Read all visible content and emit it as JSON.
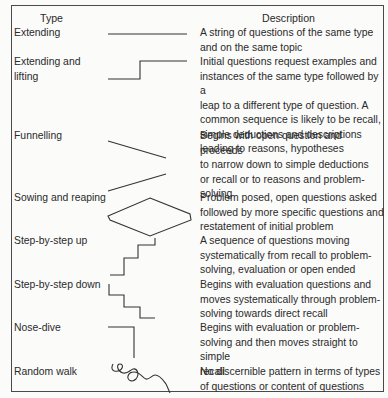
{
  "table": {
    "headers": {
      "type": "Type",
      "description": "Description"
    },
    "rows": [
      {
        "type": "Extending",
        "diagram": "flat-line-icon",
        "description": "A string of questions of the same type\nand on the same topic"
      },
      {
        "type": "Extending and\nlifting",
        "diagram": "step-up-line-icon",
        "description": "Initial questions request examples and\ninstances of the same type followed by a\nleap to a different type of question. A\ncommon sequence is likely to be recall,\nsimple deductions and descriptions\nleading to reasons, hypotheses"
      },
      {
        "type": "Funnelling",
        "diagram": "funnel-lines-icon",
        "description": "Begins with open question and proceeds\nto narrow down to simple deductions\nor recall or to reasons and problem-\nsolving"
      },
      {
        "type": "Sowing and reaping",
        "diagram": "diamond-icon",
        "description": "Problem posed, open questions asked\nfollowed by more specific questions and\nrestatement of initial problem"
      },
      {
        "type": "Step-by-step up",
        "diagram": "staircase-up-icon",
        "description": "A sequence of questions moving\nsystematically from recall to problem-\nsolving, evaluation or open ended"
      },
      {
        "type": "Step-by-step down",
        "diagram": "staircase-down-icon",
        "description": "Begins with evaluation questions and\nmoves systematically through problem-\nsolving towards direct recall"
      },
      {
        "type": "Nose-dive",
        "diagram": "nose-dive-icon",
        "description": "Begins with evaluation or problem-\nsolving and then moves straight to simple\nrecall"
      },
      {
        "type": "Random walk",
        "diagram": "squiggle-icon",
        "description": "No discernible pattern in terms of types\nof questions or content of questions"
      }
    ]
  }
}
